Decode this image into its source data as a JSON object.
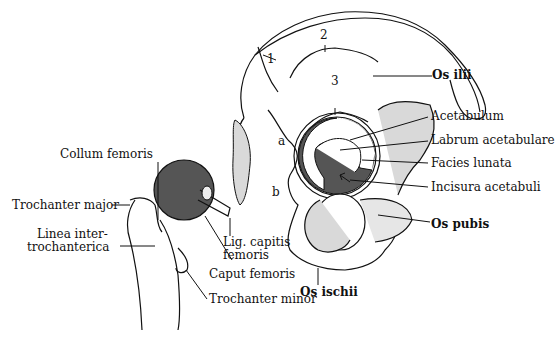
{
  "diagram": {
    "femur_labels": {
      "collum_femoris": "Collum femoris",
      "trochanter_major": "Trochanter major",
      "linea_inter_1": "Linea inter-",
      "linea_inter_2": "trochanterica",
      "lig_capitis_1": "Lig. capitis",
      "lig_capitis_2": "femoris",
      "caput_femoris": "Caput femoris",
      "trochanter_minor": "Trochanter minor"
    },
    "hip_labels": {
      "os_ilii": "Os ilii",
      "acetabulum": "Acetabulum",
      "labrum_acetabulare": "Labrum acetabulare",
      "facies_lunata": "Facies lunata",
      "incisura_acetabuli": "Incisura acetabuli",
      "os_pubis": "Os pubis",
      "os_ischii": "Os ischii"
    },
    "markers": {
      "m1": "1",
      "m2": "2",
      "m3": "3",
      "ma": "a",
      "mb": "b"
    },
    "colors": {
      "line": "#111111",
      "dark_fill": "#555555",
      "light_fill": "#d9d9d9"
    }
  }
}
